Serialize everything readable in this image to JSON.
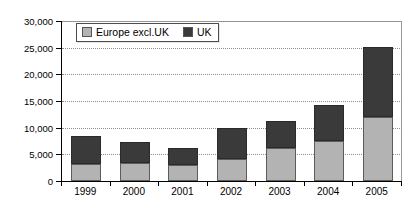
{
  "chart_data": {
    "type": "bar",
    "subtype": "stacked-vertical-bar",
    "title": "",
    "subtitle": "",
    "xlabel": "",
    "ylabel": "",
    "categories": [
      "1999",
      "2000",
      "2001",
      "2002",
      "2003",
      "2004",
      "2005"
    ],
    "series": [
      {
        "name": "Europe excl.UK",
        "color": "#b3b3b3",
        "values": [
          3100,
          3400,
          3000,
          4200,
          6100,
          7500,
          12000
        ]
      },
      {
        "name": "UK",
        "color": "#3a3a3a",
        "values": [
          5400,
          3900,
          3200,
          5800,
          5200,
          6800,
          13200
        ]
      }
    ],
    "totals": [
      8500,
      7300,
      6200,
      10000,
      11300,
      14300,
      25200
    ],
    "ylim": [
      0,
      30000
    ],
    "ytick_step": 5000,
    "ytick_labels": [
      "0",
      "5,000",
      "10,000",
      "15,000",
      "20,000",
      "25,000",
      "30,000"
    ],
    "ytick_values": [
      0,
      5000,
      10000,
      15000,
      20000,
      25000,
      30000
    ],
    "grid": true,
    "grid_axis": "y",
    "grid_style": "dotted",
    "legend_position": "inside-top-left",
    "legend_entries": [
      "Europe excl.UK",
      "UK"
    ],
    "plot_border": true
  },
  "legend": {
    "items": [
      {
        "label": "Europe excl.UK",
        "swatch_name": "legend-swatch-europe-excl-uk"
      },
      {
        "label": "UK",
        "swatch_name": "legend-swatch-uk"
      }
    ]
  },
  "colors": {
    "europe_excl_uk": "#b3b3b3",
    "uk": "#3a3a3a",
    "gridline": "#8d8d8d",
    "axis": "#000000",
    "background": "#ffffff"
  }
}
